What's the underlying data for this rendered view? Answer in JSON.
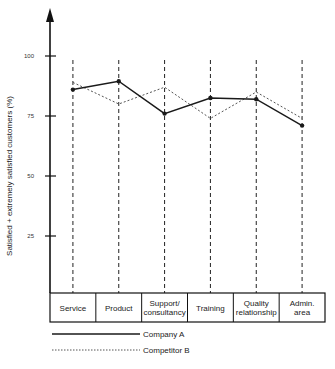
{
  "chart_data": {
    "type": "line",
    "title": "",
    "xlabel": "",
    "ylabel": "Satisfied + extremely satisfied customers (%)",
    "ylim": [
      0,
      100
    ],
    "yticks": [
      25,
      50,
      75,
      100
    ],
    "grid": false,
    "categories": [
      [
        "Service"
      ],
      [
        "Product"
      ],
      [
        "Support/",
        "consultancy"
      ],
      [
        "Training"
      ],
      [
        "Quality",
        "relationship"
      ],
      [
        "Admin.",
        "area"
      ]
    ],
    "category_names": [
      "Service",
      "Product",
      "Support/consultancy",
      "Training",
      "Quality relationship",
      "Admin. area"
    ],
    "series": [
      {
        "name": "Company A",
        "style": "solid",
        "color": "#1a1a1a",
        "markers": true,
        "values": [
          86,
          89.5,
          76,
          82.5,
          82,
          71
        ]
      },
      {
        "name": "Competitor B",
        "style": "dotted",
        "color": "#555555",
        "markers": false,
        "values": [
          89,
          80,
          87,
          74,
          85,
          74
        ]
      }
    ],
    "legend_position": "bottom-left"
  }
}
